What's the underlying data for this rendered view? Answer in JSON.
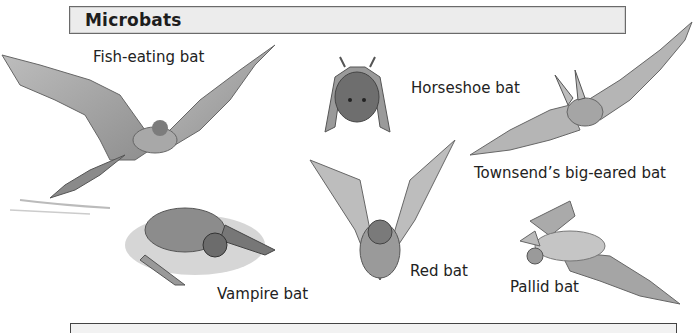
{
  "header": {
    "title": "Microbats"
  },
  "bats": [
    {
      "id": "fish-eating",
      "label": "Fish-eating bat"
    },
    {
      "id": "horseshoe",
      "label": "Horseshoe bat"
    },
    {
      "id": "townsend",
      "label": "Townsend’s big-eared bat"
    },
    {
      "id": "vampire",
      "label": "Vampire bat"
    },
    {
      "id": "red",
      "label": "Red bat"
    },
    {
      "id": "pallid",
      "label": "Pallid bat"
    }
  ],
  "colors": {
    "header_bg": "#ececec",
    "header_border": "#6a6a6a",
    "illustration": "#8a8a8a"
  }
}
